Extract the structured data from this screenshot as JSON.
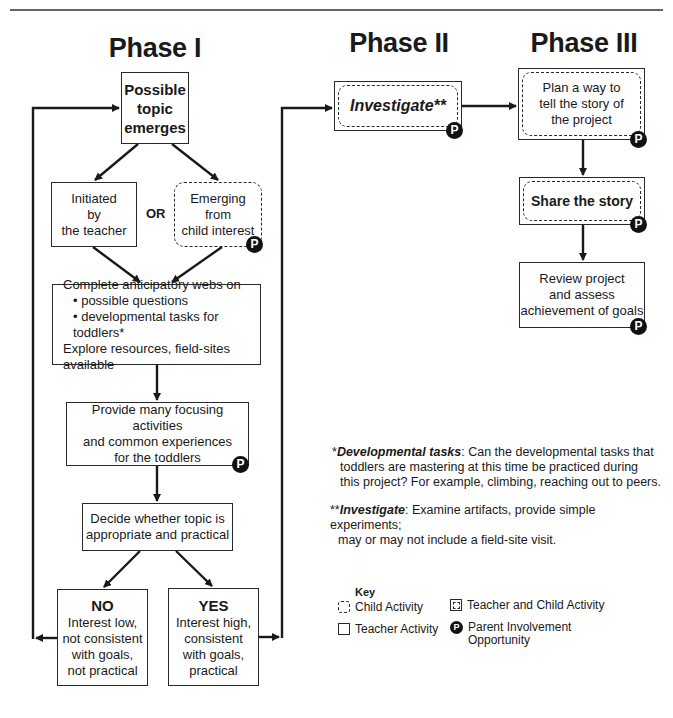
{
  "phases": {
    "phase1": {
      "title": "Phase I"
    },
    "phase2": {
      "title": "Phase II"
    },
    "phase3": {
      "title": "Phase III"
    }
  },
  "phase1_nodes": {
    "possible_topic": {
      "lines": [
        "Possible",
        "topic",
        "emerges"
      ],
      "type": "teacher"
    },
    "initiated": {
      "lines": [
        "Initiated",
        "by",
        "the teacher"
      ],
      "type": "teacher"
    },
    "or_label": "OR",
    "emerging": {
      "lines": [
        "Emerging",
        "from",
        "child interest"
      ],
      "type": "child",
      "parent_involvement": "P"
    },
    "complete_webs": {
      "line1": "Complete anticipatory webs on",
      "bullet1": "• possible questions",
      "bullet2": "• developmental tasks for toddlers*",
      "line4": "Explore resources, field-sites available",
      "type": "teacher"
    },
    "provide": {
      "lines": [
        "Provide many focusing activities",
        "and common experiences",
        "for the toddlers"
      ],
      "type": "teacher",
      "parent_involvement": "P"
    },
    "decide": {
      "lines": [
        "Decide whether topic is",
        "appropriate and practical"
      ],
      "type": "teacher"
    },
    "no": {
      "heading": "NO",
      "lines": [
        "Interest low,",
        "not consistent",
        "with goals,",
        "not practical"
      ],
      "type": "teacher"
    },
    "yes": {
      "heading": "YES",
      "lines": [
        "Interest high,",
        "consistent",
        "with goals,",
        "practical"
      ],
      "type": "teacher"
    }
  },
  "phase2_nodes": {
    "investigate": {
      "label": "Investigate**",
      "type": "teacher-and-child",
      "parent_involvement": "P"
    }
  },
  "phase3_nodes": {
    "plan": {
      "lines": [
        "Plan a way to",
        "tell the story of",
        "the project"
      ],
      "type": "teacher-and-child",
      "parent_involvement": "P"
    },
    "share": {
      "label": "Share the story",
      "type": "teacher-and-child",
      "parent_involvement": "P"
    },
    "review": {
      "lines": [
        "Review project",
        "and assess",
        "achievement of goals"
      ],
      "type": "teacher",
      "parent_involvement": "P"
    }
  },
  "notes": {
    "dev_tasks": {
      "marker": "*",
      "term": "Developmental tasks",
      "text_line1": ": Can the developmental tasks that",
      "text_line2": "toddlers are mastering at this time be practiced during",
      "text_line3": "this project? For example, climbing, reaching out to peers."
    },
    "investigate": {
      "marker": "**",
      "term": "Investigate",
      "text_line1": ": Examine artifacts, provide simple experiments;",
      "text_line2": "may or may not include a field-site visit."
    }
  },
  "key": {
    "title": "Key",
    "items": [
      {
        "label": "Child Activity",
        "icon": "dashed-rounded-box-icon"
      },
      {
        "label": "Teacher and Child Activity",
        "icon": "double-box-icon"
      },
      {
        "label": "Teacher Activity",
        "icon": "solid-box-icon"
      },
      {
        "label_line1": "Parent Involvement",
        "label_line2": "Opportunity",
        "icon": "parent-p-badge-icon",
        "badge": "P"
      }
    ]
  },
  "colors": {
    "line": "#1a1a1a",
    "badge": "#111111",
    "background": "#ffffff"
  }
}
